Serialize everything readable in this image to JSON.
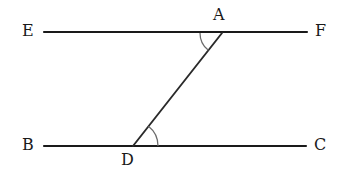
{
  "figure": {
    "background_color": "#ffffff",
    "line_color": "#1a1a1a",
    "arc_color": "#6b6b6b",
    "width": 344,
    "height": 183
  },
  "labels": {
    "e": "E",
    "f": "F",
    "a": "A",
    "b": "B",
    "c": "C",
    "d": "D"
  },
  "chart_data": {
    "type": "diagram",
    "points": [
      {
        "name": "E",
        "x": 44,
        "y": 32,
        "label": "E",
        "label_x": 22,
        "label_y": 23
      },
      {
        "name": "F",
        "x": 307,
        "y": 32,
        "label": "F",
        "label_x": 315,
        "label_y": 23
      },
      {
        "name": "A",
        "x": 222,
        "y": 33,
        "label": "A",
        "label_x": 213,
        "label_y": 7
      },
      {
        "name": "B",
        "x": 44,
        "y": 146,
        "label": "B",
        "label_x": 22,
        "label_y": 137
      },
      {
        "name": "C",
        "x": 306,
        "y": 146,
        "label": "C",
        "label_x": 314,
        "label_y": 137
      },
      {
        "name": "D",
        "x": 133,
        "y": 146,
        "label": "D",
        "label_x": 121,
        "label_y": 152
      }
    ],
    "segments": [
      {
        "name": "line-EF",
        "from": "E",
        "to": "F",
        "kind": "parallel-line"
      },
      {
        "name": "line-BC",
        "from": "B",
        "to": "C",
        "kind": "parallel-line"
      },
      {
        "name": "transversal-DA",
        "from": "D",
        "to": "A",
        "kind": "transversal"
      }
    ],
    "angle_arcs": [
      {
        "name": "angle-at-A",
        "vertex": "A",
        "between": [
          "E",
          "D"
        ],
        "radius": 22
      },
      {
        "name": "angle-at-D",
        "vertex": "D",
        "between": [
          "A",
          "C"
        ],
        "radius": 25
      }
    ],
    "xlim": [
      0,
      344
    ],
    "ylim": [
      0,
      183
    ],
    "grid": false,
    "legend": null
  }
}
